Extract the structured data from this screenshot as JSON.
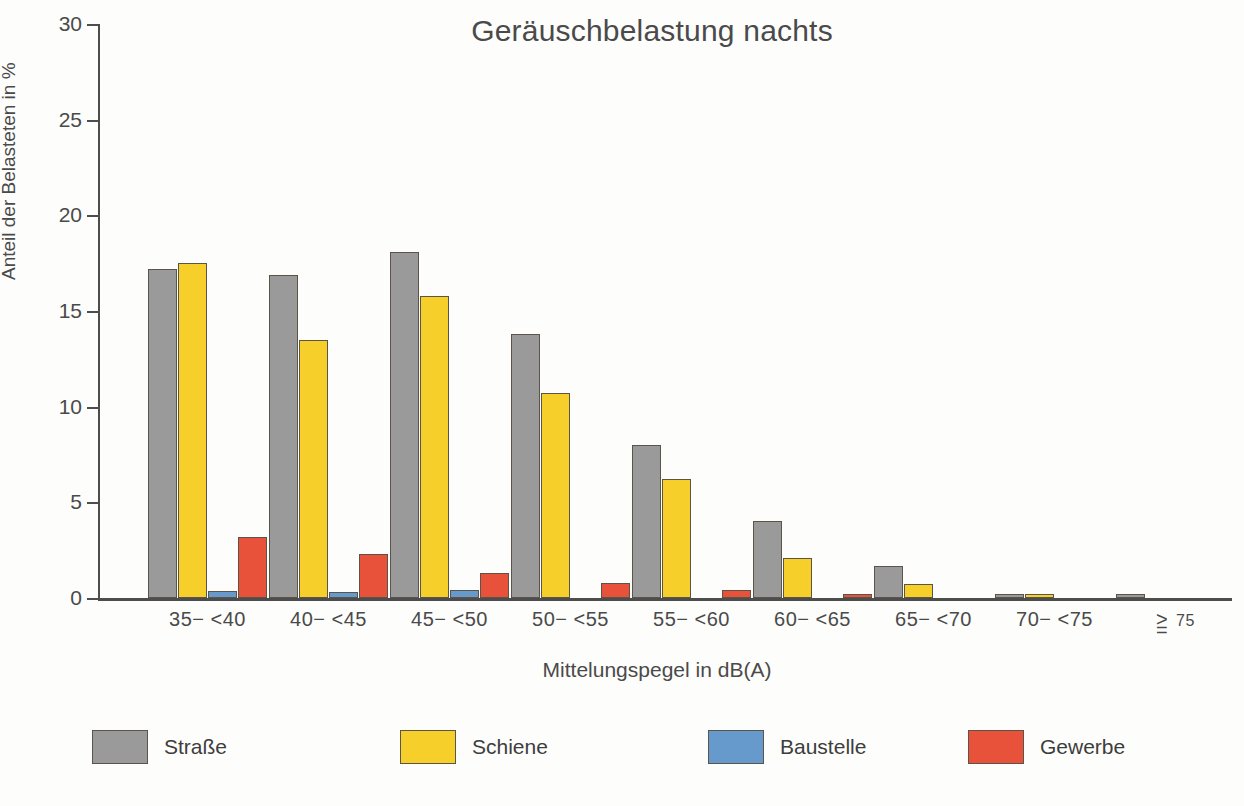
{
  "chart_data": {
    "type": "bar",
    "title": "Geräuschbelastung nachts",
    "xlabel": "Mittelungspegel in dB(A)",
    "ylabel": "Anteil der Belasteten in %",
    "ylim": [
      0,
      30
    ],
    "yticks": [
      0,
      5,
      10,
      15,
      20,
      25,
      30
    ],
    "ytick_labels": [
      "0",
      "5",
      "10",
      "15",
      "20",
      "25",
      "30"
    ],
    "grid": false,
    "legend_position": "bottom",
    "categories": [
      "35− <40",
      "40− <45",
      "45− <50",
      "50− <55",
      "55− <60",
      "60− <65",
      "65− <70",
      "70− <75",
      "≥ 75"
    ],
    "series": [
      {
        "name": "Straße",
        "color": "#9a9a9a",
        "values": [
          17.2,
          16.9,
          18.1,
          13.8,
          8.0,
          4.0,
          1.65,
          0.15,
          0.1
        ]
      },
      {
        "name": "Schiene",
        "color": "#f6cf2b",
        "values": [
          17.5,
          13.5,
          15.8,
          10.7,
          6.2,
          2.1,
          0.75,
          0.15,
          0.0
        ]
      },
      {
        "name": "Baustelle",
        "color": "#6699cc",
        "values": [
          0.35,
          0.3,
          0.4,
          0.0,
          0.0,
          0.0,
          0.0,
          0.0,
          0.0
        ]
      },
      {
        "name": "Gewerbe",
        "color": "#e8523a",
        "values": [
          3.2,
          2.3,
          1.3,
          0.8,
          0.4,
          0.1,
          0.0,
          0.0,
          0.0
        ]
      }
    ]
  },
  "legend": {
    "items": [
      {
        "label": "Straße",
        "color": "#9a9a9a"
      },
      {
        "label": "Schiene",
        "color": "#f6cf2b"
      },
      {
        "label": "Baustelle",
        "color": "#6699cc"
      },
      {
        "label": "Gewerbe",
        "color": "#e8523a"
      }
    ]
  },
  "last_category_parts": {
    "gt": ">",
    "eq": "=",
    "number": "75"
  }
}
